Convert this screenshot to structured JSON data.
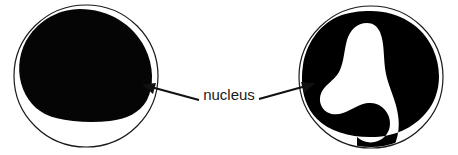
{
  "figure": {
    "background_color": "#ffffff",
    "outline_color": "#1a1a1a",
    "nucleus_fill_color": "#050505",
    "arrow_color": "#111111"
  },
  "label": {
    "text": "nucleus",
    "color": "#1a1a1a",
    "font_size_px": 15
  },
  "cells": [
    {
      "id": "left-cell",
      "name": "round-nucleus-cell",
      "membrane": {
        "center_x": 86,
        "center_y": 76,
        "radius_x": 72,
        "radius_y": 71,
        "stroke_width": 1.2
      },
      "nucleus": {
        "shape": "single-round-lobe",
        "description": "large rounded nucleus filling most of the cell, offset to the upper left"
      }
    },
    {
      "id": "right-cell",
      "name": "lobed-nucleus-cell",
      "membrane": {
        "center_x": 371,
        "center_y": 77,
        "radius_x": 72,
        "radius_y": 71,
        "stroke_width": 1.2
      },
      "nucleus": {
        "shape": "multi-lobed",
        "lobes": 3,
        "description": "three-lobed nucleus separated by a white S-shaped channel"
      }
    }
  ],
  "arrows": [
    {
      "id": "arrow-left",
      "name": "pointer-to-left-nucleus",
      "from_x": 199,
      "from_y": 100,
      "to_x": 143,
      "to_y": 85,
      "direction": "up-left",
      "head_style": "solid-triangle"
    },
    {
      "id": "arrow-right",
      "name": "pointer-to-right-nucleus",
      "from_x": 259,
      "from_y": 99,
      "to_x": 314,
      "to_y": 84,
      "direction": "up-right",
      "head_style": "solid-triangle"
    }
  ]
}
